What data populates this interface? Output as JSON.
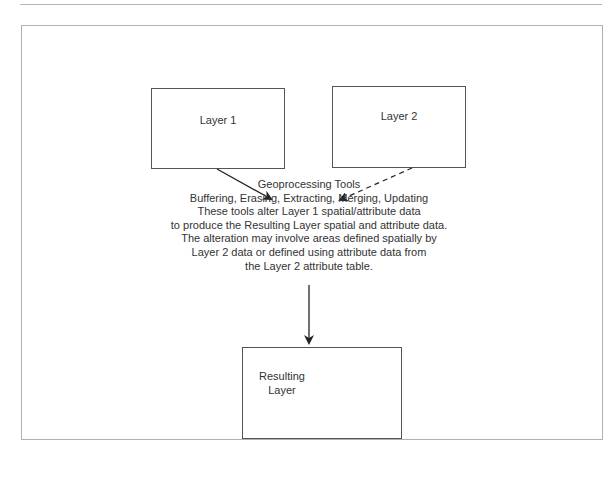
{
  "nodes": {
    "layer1": {
      "label": "Layer 1"
    },
    "layer2": {
      "label": "Layer 2"
    },
    "result": {
      "line1": "Resulting",
      "line2": "Layer"
    }
  },
  "description": {
    "title": "Geoprocessing Tools",
    "lines": [
      "Buffering, Erasing, Extracting, Merging, Updating",
      "These tools alter Layer 1 spatial/attribute data",
      "to produce the Resulting Layer spatial and attribute data.",
      "The alteration may involve areas defined spatially by",
      "Layer 2 data or defined using attribute data from",
      "the Layer 2 attribute table."
    ]
  },
  "edges": [
    {
      "from": "layer1",
      "to": "geoprocessing",
      "style": "solid"
    },
    {
      "from": "layer2",
      "to": "geoprocessing",
      "style": "dashed"
    },
    {
      "from": "geoprocessing",
      "to": "result",
      "style": "solid"
    }
  ]
}
